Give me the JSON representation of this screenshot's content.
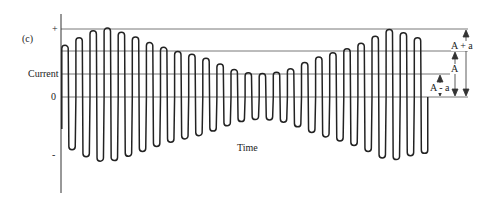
{
  "figure": {
    "panel_label": "(c)",
    "y_axis_label": "Current",
    "x_axis_label": "Time",
    "tick_plus": "+",
    "tick_zero": "0",
    "tick_minus": "-",
    "annotations": {
      "a_plus": "A + a",
      "a": "A",
      "a_minus": "A - a"
    },
    "colors": {
      "line": "#222222",
      "grid": "#555555"
    }
  },
  "chart_data": {
    "type": "line",
    "title": "(c)",
    "xlabel": "Time",
    "ylabel": "Current",
    "levels": {
      "A_plus_a": 1.0,
      "A": 0.69,
      "A_minus_a": 0.34,
      "zero": 0
    },
    "cycles": 26,
    "peak_envelope": [
      0.75,
      0.86,
      0.96,
      1.0,
      0.94,
      0.87,
      0.79,
      0.72,
      0.66,
      0.62,
      0.56,
      0.48,
      0.4,
      0.35,
      0.34,
      0.36,
      0.41,
      0.5,
      0.58,
      0.64,
      0.7,
      0.78,
      0.88,
      0.98,
      0.93,
      0.86
    ]
  }
}
